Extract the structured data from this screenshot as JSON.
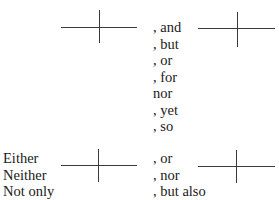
{
  "diagram": {
    "coordinating": {
      "conjunctions": [
        ", and",
        ", but",
        ", or",
        ", for",
        "nor",
        ", yet",
        ", so"
      ]
    },
    "correlative": {
      "starters": [
        "Either",
        "Neither",
        "Not only"
      ],
      "connectors": [
        ", or",
        ", nor",
        ", but also"
      ]
    }
  }
}
